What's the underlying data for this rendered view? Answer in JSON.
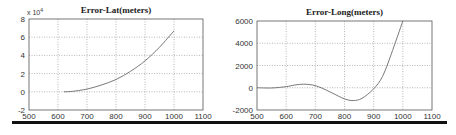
{
  "chart_data": [
    {
      "type": "line",
      "title": "Error-Lat(meters)",
      "xlabel": "",
      "ylabel": "",
      "y_multiplier_label": "x 10^4",
      "y_multiplier_base": "x 10",
      "y_multiplier_exp": "4",
      "xlim": [
        500,
        1100
      ],
      "ylim": [
        -2,
        8
      ],
      "xticks": [
        500,
        600,
        700,
        800,
        900,
        1000,
        1100
      ],
      "yticks": [
        -2,
        0,
        2,
        4,
        6,
        8
      ],
      "grid": true,
      "legend": null,
      "series": [
        {
          "name": "Error-Lat",
          "x": [
            620,
            650,
            700,
            750,
            800,
            850,
            900,
            950,
            1000
          ],
          "y": [
            0.0,
            0.05,
            0.3,
            0.75,
            1.35,
            2.25,
            3.4,
            4.9,
            6.7
          ]
        }
      ]
    },
    {
      "type": "line",
      "title": "Error-Long(meters)",
      "xlabel": "",
      "ylabel": "",
      "xlim": [
        500,
        1100
      ],
      "ylim": [
        -2000,
        6000
      ],
      "xticks": [
        500,
        600,
        700,
        800,
        900,
        1000,
        1100
      ],
      "yticks": [
        -2000,
        0,
        2000,
        4000,
        6000
      ],
      "grid": true,
      "legend": null,
      "series": [
        {
          "name": "Error-Long",
          "x": [
            500,
            550,
            600,
            630,
            660,
            690,
            720,
            760,
            800,
            830,
            860,
            900,
            930,
            960,
            1000
          ],
          "y": [
            0,
            -20,
            100,
            250,
            320,
            250,
            0,
            -500,
            -1000,
            -1150,
            -950,
            -100,
            1000,
            3000,
            6000
          ]
        }
      ]
    }
  ]
}
